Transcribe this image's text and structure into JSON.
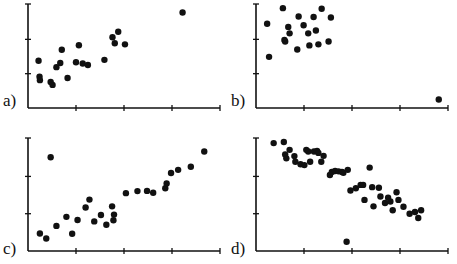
{
  "figure": {
    "title": "",
    "background_color": "#ffffff",
    "ink_color": "#111111",
    "width": 457,
    "height": 264
  },
  "panels": [
    {
      "id": "a",
      "label": "a)",
      "label_x": 3,
      "label_y": 92,
      "origin_x": 28,
      "origin_y": 108,
      "plot_width": 192,
      "plot_height": 104,
      "x_ticks": [
        0.25,
        0.5,
        0.75,
        1.0
      ],
      "y_ticks": [
        0.33,
        0.66,
        1.0
      ]
    },
    {
      "id": "b",
      "label": "b)",
      "label_x": 231,
      "label_y": 92,
      "origin_x": 256,
      "origin_y": 108,
      "plot_width": 192,
      "plot_height": 104,
      "x_ticks": [
        0.25,
        0.5,
        0.75,
        1.0
      ],
      "y_ticks": [
        0.33,
        0.66,
        1.0
      ]
    },
    {
      "id": "c",
      "label": "c)",
      "label_x": 3,
      "label_y": 240,
      "origin_x": 28,
      "origin_y": 251,
      "plot_width": 192,
      "plot_height": 113,
      "x_ticks": [
        0.25,
        0.5,
        0.75,
        1.0
      ],
      "y_ticks": [
        0.33,
        0.66,
        1.0
      ]
    },
    {
      "id": "d",
      "label": "d)",
      "label_x": 231,
      "label_y": 240,
      "origin_x": 256,
      "origin_y": 251,
      "plot_width": 192,
      "plot_height": 113,
      "x_ticks": [
        0.25,
        0.5,
        0.75,
        1.0
      ],
      "y_ticks": [
        0.33,
        0.66,
        1.0
      ]
    }
  ],
  "chart_data": [
    {
      "type": "scatter",
      "id": "a",
      "title": "a)",
      "xlabel": "",
      "ylabel": "",
      "xlim": [
        0,
        1
      ],
      "ylim": [
        0,
        1
      ],
      "grid": false,
      "legend": "none",
      "annotation": "Positive linear cluster with one high outlier at upper right",
      "marker_radius": 3.2,
      "marker_color": "#111111",
      "points": [
        [
          0.055,
          0.455
        ],
        [
          0.06,
          0.3
        ],
        [
          0.062,
          0.268
        ],
        [
          0.118,
          0.25
        ],
        [
          0.128,
          0.222
        ],
        [
          0.148,
          0.393
        ],
        [
          0.168,
          0.432
        ],
        [
          0.176,
          0.56
        ],
        [
          0.206,
          0.288
        ],
        [
          0.25,
          0.44
        ],
        [
          0.265,
          0.603
        ],
        [
          0.285,
          0.428
        ],
        [
          0.312,
          0.413
        ],
        [
          0.398,
          0.463
        ],
        [
          0.44,
          0.68
        ],
        [
          0.452,
          0.622
        ],
        [
          0.47,
          0.733
        ],
        [
          0.505,
          0.612
        ],
        [
          0.805,
          0.918
        ]
      ]
    },
    {
      "type": "scatter",
      "id": "b",
      "title": "b)",
      "xlabel": "",
      "ylabel": "",
      "xlim": [
        0,
        1
      ],
      "ylim": [
        0,
        1
      ],
      "grid": false,
      "legend": "none",
      "annotation": "Dense cluster in upper left with one distant outlier at lower right",
      "marker_radius": 3.2,
      "marker_color": "#111111",
      "points": [
        [
          0.058,
          0.81
        ],
        [
          0.068,
          0.492
        ],
        [
          0.14,
          0.96
        ],
        [
          0.148,
          0.655
        ],
        [
          0.152,
          0.64
        ],
        [
          0.168,
          0.78
        ],
        [
          0.175,
          0.718
        ],
        [
          0.215,
          0.562
        ],
        [
          0.222,
          0.88
        ],
        [
          0.248,
          0.795
        ],
        [
          0.272,
          0.718
        ],
        [
          0.278,
          0.602
        ],
        [
          0.3,
          0.875
        ],
        [
          0.312,
          0.745
        ],
        [
          0.325,
          0.612
        ],
        [
          0.342,
          0.955
        ],
        [
          0.378,
          0.64
        ],
        [
          0.39,
          0.87
        ],
        [
          0.952,
          0.082
        ]
      ]
    },
    {
      "type": "scatter",
      "id": "c",
      "title": "c)",
      "xlabel": "",
      "ylabel": "",
      "xlim": [
        0,
        1
      ],
      "ylim": [
        0,
        1
      ],
      "grid": false,
      "legend": "none",
      "annotation": "Positive linear trend with one high outlier above the line at left",
      "marker_radius": 3.2,
      "marker_color": "#111111",
      "points": [
        [
          0.062,
          0.155
        ],
        [
          0.095,
          0.11
        ],
        [
          0.118,
          0.83
        ],
        [
          0.148,
          0.222
        ],
        [
          0.2,
          0.302
        ],
        [
          0.23,
          0.152
        ],
        [
          0.258,
          0.275
        ],
        [
          0.3,
          0.385
        ],
        [
          0.32,
          0.455
        ],
        [
          0.345,
          0.262
        ],
        [
          0.38,
          0.318
        ],
        [
          0.408,
          0.232
        ],
        [
          0.438,
          0.395
        ],
        [
          0.445,
          0.272
        ],
        [
          0.448,
          0.322
        ],
        [
          0.51,
          0.512
        ],
        [
          0.57,
          0.53
        ],
        [
          0.62,
          0.532
        ],
        [
          0.652,
          0.515
        ],
        [
          0.715,
          0.555
        ],
        [
          0.722,
          0.598
        ],
        [
          0.745,
          0.69
        ],
        [
          0.782,
          0.718
        ],
        [
          0.848,
          0.745
        ],
        [
          0.918,
          0.88
        ]
      ]
    },
    {
      "type": "scatter",
      "id": "d",
      "title": "d)",
      "xlabel": "",
      "ylabel": "",
      "xlim": [
        0,
        1
      ],
      "ylim": [
        0,
        1
      ],
      "grid": false,
      "legend": "none",
      "annotation": "Negative trend cloud with one low outlier below the trend near the centre",
      "marker_radius": 3.2,
      "marker_color": "#111111",
      "points": [
        [
          0.092,
          0.955
        ],
        [
          0.145,
          0.965
        ],
        [
          0.152,
          0.855
        ],
        [
          0.158,
          0.82
        ],
        [
          0.175,
          0.895
        ],
        [
          0.2,
          0.84
        ],
        [
          0.205,
          0.79
        ],
        [
          0.232,
          0.768
        ],
        [
          0.252,
          0.76
        ],
        [
          0.262,
          0.895
        ],
        [
          0.272,
          0.88
        ],
        [
          0.282,
          0.79
        ],
        [
          0.302,
          0.88
        ],
        [
          0.318,
          0.885
        ],
        [
          0.325,
          0.868
        ],
        [
          0.34,
          0.79
        ],
        [
          0.352,
          0.842
        ],
        [
          0.385,
          0.672
        ],
        [
          0.395,
          0.7
        ],
        [
          0.412,
          0.708
        ],
        [
          0.43,
          0.705
        ],
        [
          0.448,
          0.7
        ],
        [
          0.455,
          0.692
        ],
        [
          0.478,
          0.718
        ],
        [
          0.492,
          0.535
        ],
        [
          0.52,
          0.555
        ],
        [
          0.545,
          0.585
        ],
        [
          0.558,
          0.585
        ],
        [
          0.565,
          0.452
        ],
        [
          0.592,
          0.738
        ],
        [
          0.605,
          0.565
        ],
        [
          0.612,
          0.395
        ],
        [
          0.64,
          0.56
        ],
        [
          0.648,
          0.482
        ],
        [
          0.672,
          0.425
        ],
        [
          0.688,
          0.472
        ],
        [
          0.7,
          0.438
        ],
        [
          0.712,
          0.36
        ],
        [
          0.732,
          0.52
        ],
        [
          0.742,
          0.452
        ],
        [
          0.768,
          0.392
        ],
        [
          0.8,
          0.33
        ],
        [
          0.828,
          0.345
        ],
        [
          0.845,
          0.292
        ],
        [
          0.86,
          0.36
        ],
        [
          0.472,
          0.082
        ]
      ]
    }
  ]
}
